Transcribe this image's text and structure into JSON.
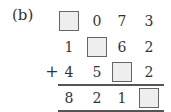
{
  "label": "(b)",
  "operator": "+",
  "rows": [
    [
      "box",
      "0",
      "7",
      "3"
    ],
    [
      "1",
      "box",
      "6",
      "2"
    ],
    [
      "4",
      "5",
      "box",
      "2"
    ],
    [
      "8",
      "2",
      "1",
      "box"
    ]
  ],
  "colors": {
    "box_fill": "#eeeeee",
    "box_border": "#666666",
    "text": "#333333"
  }
}
